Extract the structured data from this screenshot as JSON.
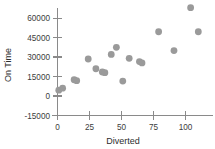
{
  "chart_data": {
    "type": "scatter",
    "title": "",
    "xlabel": "Diverted",
    "ylabel": "On Time",
    "xlim": [
      -4,
      116
    ],
    "ylim": [
      -15000,
      70000
    ],
    "xticks": [
      0,
      25,
      50,
      75,
      100
    ],
    "yticks": [
      -15000,
      0,
      15000,
      30000,
      45000,
      60000
    ],
    "xtick_labels": [
      "0",
      "25",
      "50",
      "75",
      "100"
    ],
    "ytick_labels": [
      "-15000",
      "0",
      "15000",
      "30000",
      "45000",
      "60000"
    ],
    "grid": false,
    "legend": null,
    "marker": {
      "shape": "circle",
      "color": "#9a9a9a",
      "size": 3.4
    },
    "points": [
      {
        "x": 1,
        "y": 4500
      },
      {
        "x": 4,
        "y": 6000
      },
      {
        "x": 13,
        "y": 12500
      },
      {
        "x": 15,
        "y": 11800
      },
      {
        "x": 24,
        "y": 28500
      },
      {
        "x": 30,
        "y": 21000
      },
      {
        "x": 35,
        "y": 18500
      },
      {
        "x": 37,
        "y": 18000
      },
      {
        "x": 42,
        "y": 32000
      },
      {
        "x": 46,
        "y": 37500
      },
      {
        "x": 51,
        "y": 11500
      },
      {
        "x": 56,
        "y": 29000
      },
      {
        "x": 64,
        "y": 26500
      },
      {
        "x": 66,
        "y": 25500
      },
      {
        "x": 79,
        "y": 49500
      },
      {
        "x": 91,
        "y": 35000
      },
      {
        "x": 104,
        "y": 68000
      },
      {
        "x": 110,
        "y": 49500
      }
    ]
  },
  "axes": {
    "y_label": "On Time",
    "x_label": "Diverted"
  }
}
